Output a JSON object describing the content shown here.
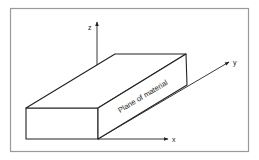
{
  "diagram": {
    "axes": {
      "x_label": "x",
      "y_label": "y",
      "z_label": "z"
    },
    "face_label": "Plane of material",
    "colors": {
      "stroke": "#222222",
      "frame": "#9a9a9a",
      "background": "#ffffff"
    }
  }
}
